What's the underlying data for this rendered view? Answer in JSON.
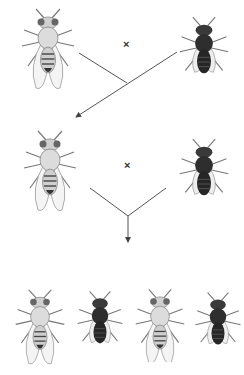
{
  "diagram": {
    "cross_symbol": "×",
    "generations": [
      {
        "name": "P",
        "flies": [
          {
            "phenotype": "wild-type (light body)",
            "color": "light"
          },
          {
            "phenotype": "ebony (dark body)",
            "color": "dark"
          }
        ]
      },
      {
        "name": "F1 x testcross",
        "flies": [
          {
            "phenotype": "wild-type (light body)",
            "color": "light"
          },
          {
            "phenotype": "ebony (dark body)",
            "color": "dark"
          }
        ]
      },
      {
        "name": "Progeny",
        "flies": [
          {
            "phenotype": "wild-type (light body)",
            "color": "light"
          },
          {
            "phenotype": "ebony (dark body)",
            "color": "dark"
          },
          {
            "phenotype": "wild-type (light body)",
            "color": "light"
          },
          {
            "phenotype": "ebony (dark body)",
            "color": "dark"
          }
        ]
      }
    ],
    "colors": {
      "light_body": "#d8d8d8",
      "dark_body": "#2a2a2a",
      "line": "#555555"
    }
  }
}
